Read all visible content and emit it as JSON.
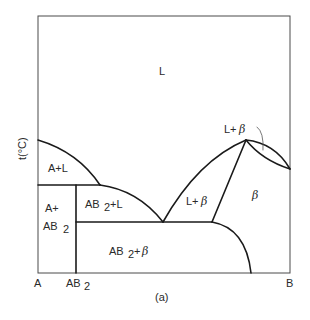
{
  "diagram": {
    "type": "binary-phase-diagram",
    "caption": "(a)",
    "y_axis_label": "t(°C)",
    "x_axis_labels": {
      "left": "A",
      "compound": "AB",
      "compound_sub": "2",
      "right": "B"
    },
    "regions": {
      "liquid": "L",
      "a_plus_l": "A+L",
      "a_plus_ab2_line1": "A+",
      "a_plus_ab2_line2": "AB",
      "a_plus_ab2_sub": "2",
      "ab2_plus_l_main": "AB",
      "ab2_plus_l_sub": "2",
      "ab2_plus_l_rest": "+L",
      "l_plus_beta_center_main": "L+",
      "l_plus_beta_center_greek": "β",
      "beta": "β",
      "ab2_plus_beta_main": "AB",
      "ab2_plus_beta_sub": "2",
      "ab2_plus_beta_rest": "+",
      "ab2_plus_beta_greek": "β",
      "l_plus_beta_top_main": "L+",
      "l_plus_beta_top_greek": "β"
    },
    "key_points": {
      "eutectic_A_AB2_temp_line": "upper horizontal",
      "eutectic_AB2_beta_temp_line": "lower horizontal",
      "congruent_max": "peak of β liquidus"
    }
  }
}
